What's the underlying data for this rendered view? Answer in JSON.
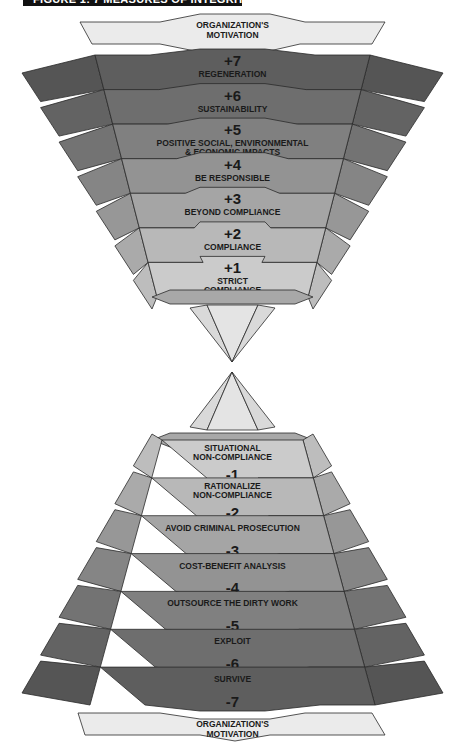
{
  "title": "FIGURE 1: 7 MEASURES OF INTEGRITY",
  "motivation_top": [
    "ORGANIZATION'S",
    "MOTIVATION"
  ],
  "motivation_bottom": [
    "ORGANIZATION'S",
    "MOTIVATION"
  ],
  "colors": {
    "motivation_fill": "#ebebeb",
    "outline": "#2a2a2a",
    "tip_fill": "#d9d9d9"
  },
  "upper_levels": [
    {
      "value": "+7",
      "lines": [
        "REGENERATION"
      ],
      "fill": "#5e5e5e",
      "side": "#555555"
    },
    {
      "value": "+6",
      "lines": [
        "SUSTAINABILITY"
      ],
      "fill": "#6e6e6e",
      "side": "#636363"
    },
    {
      "value": "+5",
      "lines": [
        "POSITIVE SOCIAL, ENVIRONMENTAL",
        "& ECONOMIC IMPACTS"
      ],
      "fill": "#808080",
      "side": "#737373"
    },
    {
      "value": "+4",
      "lines": [
        "BE RESPONSIBLE"
      ],
      "fill": "#939393",
      "side": "#858585"
    },
    {
      "value": "+3",
      "lines": [
        "BEYOND COMPLIANCE"
      ],
      "fill": "#a5a5a5",
      "side": "#979797"
    },
    {
      "value": "+2",
      "lines": [
        "COMPLIANCE"
      ],
      "fill": "#b8b8b8",
      "side": "#aaaaaa"
    },
    {
      "value": "+1",
      "lines": [
        "STRICT",
        "COMPLIANCE"
      ],
      "fill": "#cbcbcb",
      "side": "#bdbdbd"
    }
  ],
  "lower_levels": [
    {
      "value": "-1",
      "lines": [
        "SITUATIONAL",
        "NON-COMPLIANCE"
      ],
      "fill": "#cbcbcb",
      "side": "#bdbdbd"
    },
    {
      "value": "-2",
      "lines": [
        "RATIONALIZE",
        "NON-COMPLIANCE"
      ],
      "fill": "#b8b8b8",
      "side": "#aaaaaa"
    },
    {
      "value": "-3",
      "lines": [
        "AVOID CRIMINAL PROSECUTION"
      ],
      "fill": "#a5a5a5",
      "side": "#979797"
    },
    {
      "value": "-4",
      "lines": [
        "COST-BENEFIT ANALYSIS"
      ],
      "fill": "#939393",
      "side": "#858585"
    },
    {
      "value": "-5",
      "lines": [
        "OUTSOURCE THE DIRTY WORK"
      ],
      "fill": "#808080",
      "side": "#737373"
    },
    {
      "value": "-6",
      "lines": [
        "EXPLOIT"
      ],
      "fill": "#6e6e6e",
      "side": "#636363"
    },
    {
      "value": "-7",
      "lines": [
        "SURVIVE"
      ],
      "fill": "#5e5e5e",
      "side": "#555555"
    }
  ]
}
